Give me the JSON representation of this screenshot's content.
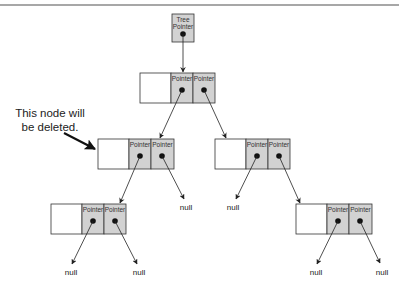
{
  "diagram": {
    "type": "binary-tree-linked-nodes",
    "colors": {
      "pointer_fill": "#d2d2d2",
      "value_fill": "#ffffff",
      "stroke": "#333333",
      "rule": "#8a8a8a"
    },
    "tree_pointer": {
      "label_line1": "Tree",
      "label_line2": "Pointer"
    },
    "pointer_label": "Pointer",
    "null_label": "null",
    "annotation": {
      "line1": "This node will",
      "line2": "be deleted."
    },
    "nodes": [
      {
        "id": "root",
        "left": "left-child",
        "right": "right-child"
      },
      {
        "id": "left-child",
        "left": "left-grandchild",
        "right": "null",
        "marked_for_deletion": true
      },
      {
        "id": "right-child",
        "left": "null",
        "right": "right-grandchild"
      },
      {
        "id": "left-grandchild",
        "left": "null",
        "right": "null"
      },
      {
        "id": "right-grandchild",
        "left": "null",
        "right": "null"
      }
    ]
  }
}
